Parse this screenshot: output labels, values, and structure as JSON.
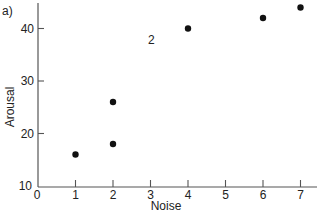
{
  "panel_label": "a)",
  "annotation": "2",
  "chart_data": {
    "type": "scatter",
    "title": "",
    "xlabel": "Noise",
    "ylabel": "Arousal",
    "xlim": [
      0,
      7
    ],
    "ylim": [
      10,
      45
    ],
    "grid": false,
    "x_ticks": [
      "0",
      "1",
      "2",
      "3",
      "4",
      "5",
      "6",
      "7"
    ],
    "y_ticks": [
      "10",
      "20",
      "30",
      "40"
    ],
    "points": [
      {
        "x": 1,
        "y": 16
      },
      {
        "x": 2,
        "y": 18
      },
      {
        "x": 2,
        "y": 26
      },
      {
        "x": 4,
        "y": 40
      },
      {
        "x": 6,
        "y": 42
      },
      {
        "x": 7,
        "y": 44
      }
    ],
    "annotations": [
      {
        "text": "2",
        "x": 3,
        "y": 37.5
      }
    ]
  }
}
